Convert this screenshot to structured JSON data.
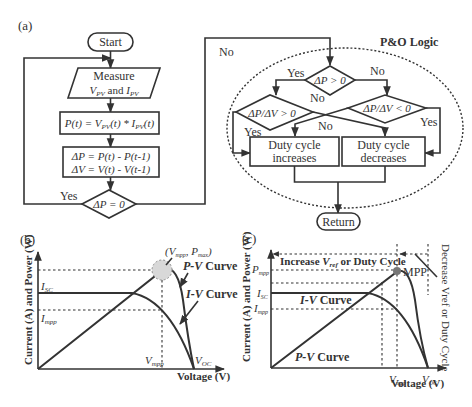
{
  "panel_a": {
    "label": "(a)",
    "start": "Start",
    "measure_line1": "Measure",
    "measure_line2": "V_PV and I_PV",
    "power_calc": "P(t) = V_PV(t) * I_PV(t)",
    "delta_p": "ΔP = P(t) - P(t-1)",
    "delta_v": "ΔV = V(t) - V(t-1)",
    "decision_dp_zero": "ΔP = 0",
    "yes": "Yes",
    "no": "No",
    "po_logic_title": "P&O Logic",
    "decision_dp_pos": "ΔP > 0",
    "decision_dpdv_pos": "ΔP/ΔV > 0",
    "decision_dpdv_neg": "ΔP/ΔV < 0",
    "duty_inc_line1": "Duty cycle",
    "duty_inc_line2": "increases",
    "duty_dec_line1": "Duty cycle",
    "duty_dec_line2": "decreases",
    "return": "Return"
  },
  "panel_b": {
    "label": "(b)",
    "ylabel": "Current (A) and Power (W)",
    "xlabel": "Voltage (V)",
    "isc": "I_SC",
    "impp": "I_mpp",
    "vmpp": "V_mpp",
    "voc": "V_OC",
    "mpp_point": "(V_mpp, P_max)",
    "pv_curve": "P-V Curve",
    "iv_curve": "I-V Curve"
  },
  "panel_c": {
    "label": "(c)",
    "ylabel": "Current (A) and Power (W)",
    "xlabel": "Voltage (V)",
    "pmpp": "P_mpp",
    "isc": "I_SC",
    "impp": "I_mpp",
    "vmpp": "V_mpp",
    "voc": "V_OC",
    "mpp": "MPP",
    "iv_curve": "I-V Curve",
    "pv_curve": "P-V Curve",
    "increase_region": "Increase V_ref or Duty Cycle",
    "decrease_region": "Decrease Vref or Duty Cycle"
  },
  "colors": {
    "line": "#333333",
    "mpp_marker": "#888888",
    "mpp_halo": "#cfcfcf"
  }
}
